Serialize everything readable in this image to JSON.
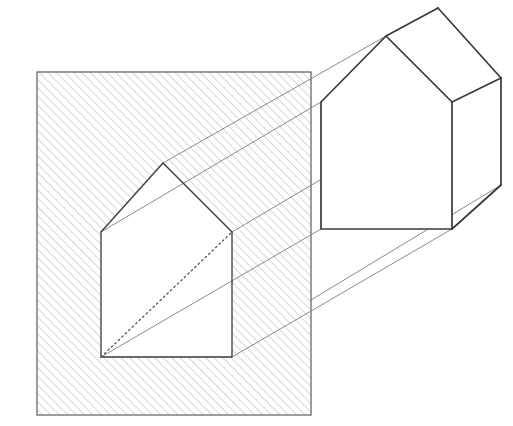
{
  "figure": {
    "title": "Perspective projection of a house-shaped aperture",
    "canvas": {
      "width": 513,
      "height": 426,
      "background": "#ffffff"
    },
    "colors": {
      "outline": "#3a3a3a",
      "hatch": "#9a9a9a",
      "ray": "#7d7d7d",
      "hidden": "#5a5a5a",
      "paper": "#ffffff"
    },
    "stroke_widths": {
      "outline": 1.6,
      "aperture": 1.3,
      "ray": 0.9,
      "hatch": 0.8,
      "hidden": 1.1
    },
    "hatch": {
      "angle_deg": 45,
      "spacing_px": 6,
      "direction": "lower-left to upper-right"
    },
    "picture_plane": {
      "label": "hatched picture plane",
      "corners": [
        [
          37,
          72
        ],
        [
          311,
          72
        ],
        [
          311,
          415
        ],
        [
          37,
          415
        ]
      ]
    },
    "aperture": {
      "label": "house-shaped opening",
      "points": [
        [
          163,
          163
        ],
        [
          232,
          232
        ],
        [
          232,
          357
        ],
        [
          101,
          357
        ],
        [
          101,
          232
        ]
      ],
      "vertex_names": [
        "apex",
        "right-eave",
        "bottom-right",
        "bottom-left",
        "left-eave"
      ]
    },
    "hidden_lines": [
      {
        "name": "apex-to-left-eave-diagonal",
        "from": [
          101,
          232
        ],
        "to": [
          163,
          163
        ]
      },
      {
        "name": "bottom-left-to-right-eave-diagonal",
        "from": [
          101,
          357
        ],
        "to": [
          232,
          232
        ]
      }
    ],
    "solid": {
      "label": "house prism",
      "near_gable": [
        [
          386,
          36
        ],
        [
          452,
          102
        ],
        [
          452,
          229
        ],
        [
          321,
          229
        ],
        [
          321,
          102
        ]
      ],
      "far_ridge_apex": [
        438,
        8
      ],
      "far_right_eave": [
        501,
        78
      ],
      "far_right_base": [
        501,
        185
      ],
      "ridge": {
        "from": [
          386,
          36
        ],
        "to": [
          438,
          8
        ]
      },
      "roof_right_edge": {
        "from": [
          438,
          8
        ],
        "to": [
          501,
          78
        ]
      },
      "far_eave_edge": {
        "from": [
          452,
          102
        ],
        "to": [
          501,
          78
        ]
      },
      "right_vertical": {
        "from": [
          501,
          78
        ],
        "to": [
          501,
          185
        ]
      },
      "base_right_edge": {
        "from": [
          452,
          229
        ],
        "to": [
          501,
          185
        ]
      }
    },
    "projection_rays": [
      {
        "name": "ray-apex",
        "from": [
          163,
          163
        ],
        "to": [
          386,
          36
        ]
      },
      {
        "name": "ray-left-eave",
        "from": [
          101,
          232
        ],
        "to": [
          321,
          102
        ]
      },
      {
        "name": "ray-right-eave",
        "from": [
          232,
          232
        ],
        "to": [
          452,
          102
        ]
      },
      {
        "name": "ray-bottom-left",
        "from": [
          101,
          357
        ],
        "to": [
          321,
          229
        ]
      },
      {
        "name": "ray-bottom-right",
        "from": [
          232,
          357
        ],
        "to": [
          452,
          229
        ]
      },
      {
        "name": "ray-far-base",
        "from": [
          311,
          300
        ],
        "to": [
          501,
          185
        ]
      }
    ]
  }
}
